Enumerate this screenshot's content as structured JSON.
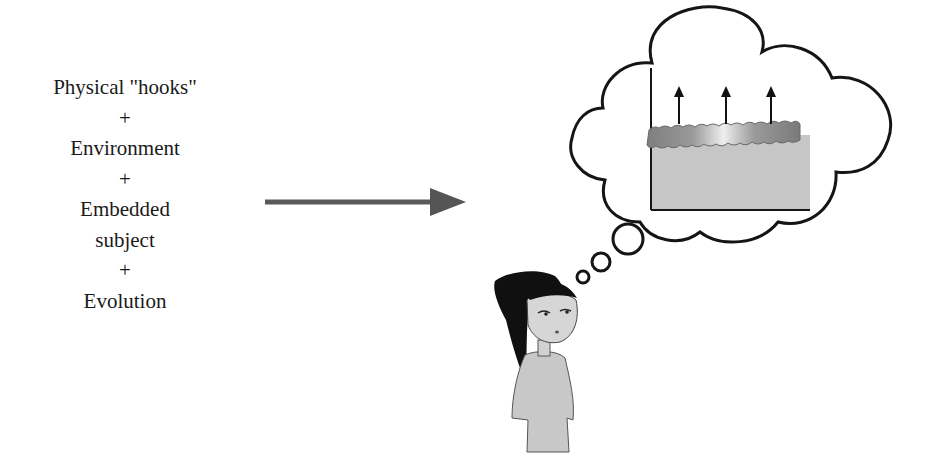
{
  "formula": {
    "lines": [
      {
        "text": "Physical \"hooks\"",
        "kind": "term"
      },
      {
        "text": "+",
        "kind": "operator"
      },
      {
        "text": "Environment",
        "kind": "term"
      },
      {
        "text": "+",
        "kind": "operator"
      },
      {
        "text": "Embedded",
        "kind": "term"
      },
      {
        "text": "subject",
        "kind": "term"
      },
      {
        "text": "+",
        "kind": "operator"
      },
      {
        "text": "Evolution",
        "kind": "term"
      }
    ]
  },
  "arrow": {
    "direction": "right",
    "color": "#555555"
  },
  "thought": {
    "figure": "girl-thinking",
    "bubble_content": "layered-block-with-upward-arrows",
    "up_arrow_count": 3,
    "colors": {
      "outline": "#1a1a1a",
      "block_fill": "#c4c4c4",
      "top_layer": "#8a8a8a",
      "hair": "#111111",
      "dress": "#c8c8c8"
    }
  }
}
